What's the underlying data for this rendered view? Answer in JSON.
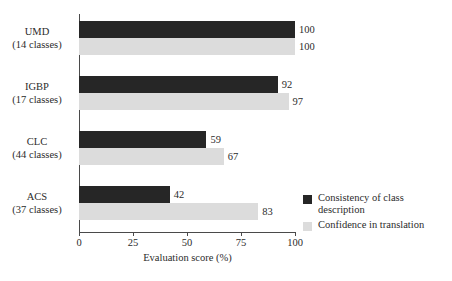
{
  "chart_data": {
    "type": "bar",
    "orientation": "horizontal",
    "title": "",
    "xlabel": "Evaluation score (%)",
    "ylabel": "",
    "xlim": [
      0,
      100
    ],
    "xticks": [
      0,
      25,
      50,
      75,
      100
    ],
    "xtick_labels": [
      "0",
      "25",
      "50",
      "75",
      "100"
    ],
    "grid": false,
    "legend_position": "bottom-right",
    "categories": [
      {
        "name": "UMD",
        "sub": "(14 classes)"
      },
      {
        "name": "IGBP",
        "sub": "(17 classes)"
      },
      {
        "name": "CLC",
        "sub": "(44 classes)"
      },
      {
        "name": "ACS",
        "sub": "(37 classes)"
      }
    ],
    "category_labels": [
      "UMD (14 classes)",
      "IGBP (17 classes)",
      "CLC (44 classes)",
      "ACS (37 classes)"
    ],
    "series": [
      {
        "name": "Consistency of class description",
        "legend_line1": "Consistency of class",
        "legend_line2": "description",
        "color": "#262626",
        "values": [
          100,
          92,
          59,
          42
        ],
        "value_labels": [
          "100",
          "92",
          "59",
          "42"
        ]
      },
      {
        "name": "Confidence in translation",
        "legend_line1": "Confidence in translation",
        "legend_line2": "",
        "color": "#dcdcdc",
        "values": [
          100,
          97,
          67,
          83
        ],
        "value_labels": [
          "100",
          "97",
          "67",
          "83"
        ]
      }
    ]
  }
}
